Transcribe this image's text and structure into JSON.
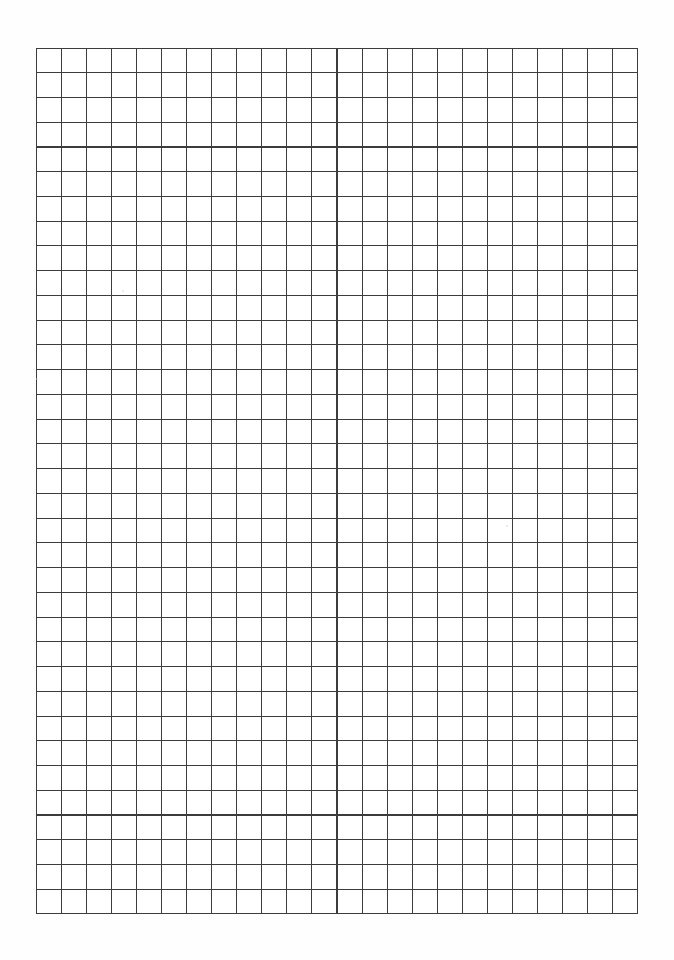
{
  "document": {
    "kind": "grid-paper-scan",
    "page_width": 674,
    "page_height": 960,
    "background_color": "#ffffff",
    "paper_tint": "#fefefe",
    "content_description": "Blank scanned sheet of square grid (quadrille) paper with no handwriting, text, or annotations."
  },
  "grid": {
    "x": 36,
    "y": 48,
    "width": 602,
    "height": 866,
    "columns": 24,
    "rows": 35,
    "cell_width": 25.08,
    "cell_height": 24.74,
    "line_color": "#3c3c3c",
    "line_width": 1.1,
    "border_color": "#3c3c3c",
    "border_width": 1.3,
    "cell_fill": "#ffffff"
  },
  "margins": {
    "top_label": "top margin",
    "top_height": 48,
    "bottom_label": "bottom margin",
    "bottom_height": 46,
    "left_label": "left margin",
    "left_width": 36,
    "right_label": "right margin",
    "right_width": 36
  },
  "artifacts": [
    {
      "name": "scan-speckle-1",
      "x": 122,
      "y": 290,
      "size": 2
    },
    {
      "name": "scan-speckle-2",
      "x": 506,
      "y": 525,
      "size": 2
    },
    {
      "name": "scan-speckle-3",
      "x": 36,
      "y": 378,
      "size": 2
    }
  ]
}
